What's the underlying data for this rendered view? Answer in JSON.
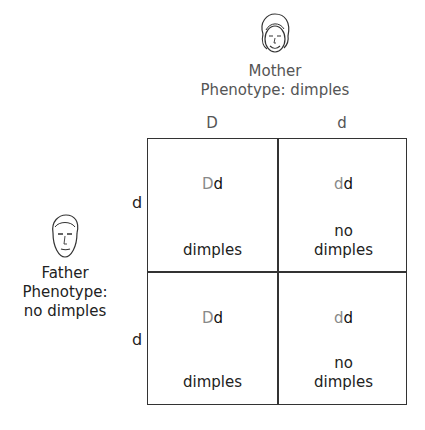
{
  "mother": {
    "icon": "female-face-icon",
    "title": "Mother",
    "phenotype": "Phenotype: dimples",
    "alleles": [
      "D",
      "d"
    ]
  },
  "father": {
    "icon": "male-face-icon",
    "title": "Father",
    "phenotype_line1": "Phenotype:",
    "phenotype_line2": "no dimples",
    "alleles": [
      "d",
      "d"
    ]
  },
  "grid": {
    "cells": [
      {
        "mother_allele": "D",
        "father_allele": "d",
        "phenotype_line1": "",
        "phenotype_line2": "dimples"
      },
      {
        "mother_allele": "d",
        "father_allele": "d",
        "phenotype_line1": "no",
        "phenotype_line2": "dimples"
      },
      {
        "mother_allele": "D",
        "father_allele": "d",
        "phenotype_line1": "",
        "phenotype_line2": "dimples"
      },
      {
        "mother_allele": "d",
        "father_allele": "d",
        "phenotype_line1": "no",
        "phenotype_line2": "dimples"
      }
    ]
  },
  "colors": {
    "mother_allele": "#888888",
    "father_allele": "#111111",
    "grid_line": "#333333"
  }
}
